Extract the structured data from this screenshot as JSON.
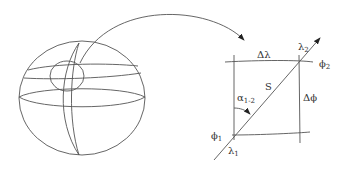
{
  "diagram": {
    "labels": {
      "delta_lambda": "Δλ",
      "delta_phi": "Δϕ",
      "lambda": "λ",
      "phi": "ϕ",
      "alpha": "α",
      "alpha_sub": "1-2",
      "s": "S",
      "sub1": "1",
      "sub2": "2"
    },
    "colors": {
      "stroke": "#555555",
      "text": "#333333",
      "background": "#ffffff"
    }
  }
}
